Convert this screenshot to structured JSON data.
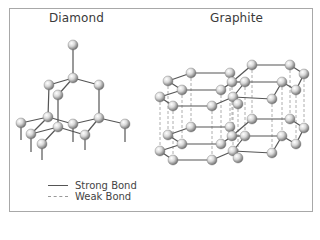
{
  "titles": {
    "diamond": "Diamond",
    "graphite": "Graphite"
  },
  "legend": {
    "strong": "Strong Bond",
    "weak": "Weak Bond"
  },
  "colors": {
    "border": "#a8a8a8",
    "strong_bond": "#555555",
    "weak_bond": "#9a9a9a",
    "atom_light": "#ffffff",
    "atom_dark": "#7a7a7a"
  },
  "diamond": {
    "atoms": [
      [
        73,
        45
      ],
      [
        73,
        78
      ],
      [
        49,
        85
      ],
      [
        58,
        95
      ],
      [
        99,
        85
      ],
      [
        21,
        123
      ],
      [
        48,
        117
      ],
      [
        31,
        134
      ],
      [
        58,
        127
      ],
      [
        42,
        144
      ],
      [
        73,
        124
      ],
      [
        99,
        118
      ],
      [
        125,
        124
      ],
      [
        85,
        135
      ]
    ],
    "bonds": [
      [
        0,
        1
      ],
      [
        1,
        2
      ],
      [
        1,
        3
      ],
      [
        1,
        4
      ],
      [
        2,
        6
      ],
      [
        3,
        8
      ],
      [
        4,
        11
      ],
      [
        5,
        6
      ],
      [
        6,
        7
      ],
      [
        7,
        8
      ],
      [
        8,
        9
      ],
      [
        6,
        10
      ],
      [
        8,
        13
      ],
      [
        10,
        11
      ],
      [
        11,
        12
      ],
      [
        11,
        13
      ]
    ],
    "stubs": [
      [
        5,
        17
      ],
      [
        7,
        18
      ],
      [
        9,
        16
      ],
      [
        10,
        18
      ],
      [
        12,
        18
      ],
      [
        13,
        15
      ],
      [
        0,
        0
      ]
    ]
  },
  "graphite": {
    "layer_offset": 54,
    "atoms": [
      [
        168,
        81
      ],
      [
        191,
        73
      ],
      [
        230,
        73
      ],
      [
        252,
        65
      ],
      [
        290,
        65
      ],
      [
        304,
        74
      ],
      [
        182,
        90
      ],
      [
        221,
        90
      ],
      [
        232,
        82
      ],
      [
        245,
        82
      ],
      [
        282,
        82
      ],
      [
        296,
        90
      ],
      [
        160,
        97
      ],
      [
        173,
        106
      ],
      [
        212,
        106
      ],
      [
        233,
        97
      ],
      [
        272,
        99
      ],
      [
        238,
        104
      ]
    ],
    "bonds": [
      [
        0,
        1
      ],
      [
        1,
        2
      ],
      [
        2,
        8
      ],
      [
        8,
        7
      ],
      [
        7,
        6
      ],
      [
        6,
        0
      ],
      [
        8,
        3
      ],
      [
        3,
        4
      ],
      [
        4,
        5
      ],
      [
        5,
        11
      ],
      [
        11,
        10
      ],
      [
        10,
        9
      ],
      [
        9,
        8
      ],
      [
        12,
        13
      ],
      [
        13,
        14
      ],
      [
        14,
        15
      ],
      [
        15,
        9
      ],
      [
        12,
        6
      ],
      [
        15,
        16
      ],
      [
        16,
        10
      ]
    ]
  }
}
